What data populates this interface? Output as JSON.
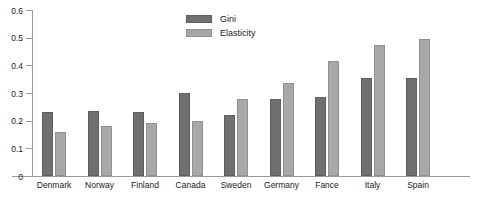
{
  "chart_data": {
    "type": "bar",
    "title": "",
    "xlabel": "",
    "ylabel": "",
    "ylim": [
      0,
      0.6
    ],
    "yticks": [
      "0",
      "0.1",
      "0.2",
      "0.3",
      "0.4",
      "0.5",
      "0.6"
    ],
    "ytick_values": [
      0,
      0.1,
      0.2,
      0.3,
      0.4,
      0.5,
      0.6
    ],
    "grid": false,
    "legend_position": "top-center",
    "categories": [
      "Denmark",
      "Norway",
      "Finland",
      "Canada",
      "Sweden",
      "Germany",
      "Fance",
      "Italy",
      "Spain"
    ],
    "series": [
      {
        "name": "Gini",
        "color": "#707070",
        "values": [
          0.23,
          0.235,
          0.23,
          0.3,
          0.22,
          0.28,
          0.285,
          0.355,
          0.355
        ]
      },
      {
        "name": "Elasticity",
        "color": "#a8a8a8",
        "values": [
          0.16,
          0.18,
          0.19,
          0.2,
          0.28,
          0.335,
          0.415,
          0.475,
          0.495
        ]
      }
    ]
  },
  "legend": {
    "items": [
      {
        "label": "Gini"
      },
      {
        "label": "Elasticity"
      }
    ]
  }
}
